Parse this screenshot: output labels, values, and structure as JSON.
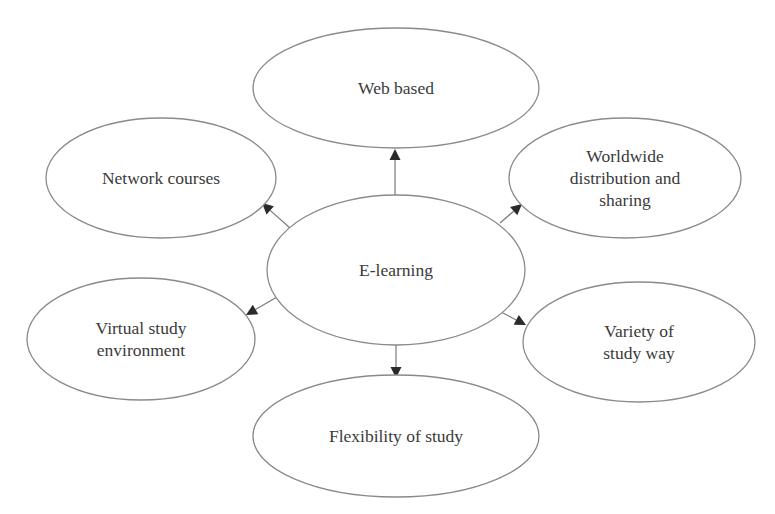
{
  "diagram": {
    "type": "mind-map",
    "center": {
      "id": "e-learning",
      "label_lines": [
        "E-learning"
      ]
    },
    "nodes": [
      {
        "id": "web-based",
        "label_lines": [
          "Web based"
        ]
      },
      {
        "id": "network-courses",
        "label_lines": [
          "Network courses"
        ]
      },
      {
        "id": "worldwide-distribution",
        "label_lines": [
          "Worldwide",
          "distribution and",
          "sharing"
        ]
      },
      {
        "id": "virtual-study-environment",
        "label_lines": [
          "Virtual study",
          "environment"
        ]
      },
      {
        "id": "variety-of-study-way",
        "label_lines": [
          "Variety of",
          "study way"
        ]
      },
      {
        "id": "flexibility-of-study",
        "label_lines": [
          "Flexibility of study"
        ]
      }
    ],
    "edges": [
      {
        "from": "e-learning",
        "to": "web-based"
      },
      {
        "from": "e-learning",
        "to": "network-courses"
      },
      {
        "from": "e-learning",
        "to": "worldwide-distribution"
      },
      {
        "from": "e-learning",
        "to": "virtual-study-environment"
      },
      {
        "from": "e-learning",
        "to": "variety-of-study-way"
      },
      {
        "from": "e-learning",
        "to": "flexibility-of-study"
      }
    ],
    "colors": {
      "stroke": "#8a8a8a",
      "text": "#3a3a3a",
      "arrow": "#2a2a2a",
      "background": "#ffffff"
    }
  }
}
